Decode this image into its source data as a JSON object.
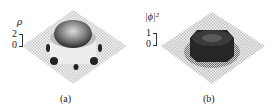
{
  "figure": {
    "panels": [
      {
        "id": "a",
        "caption": "(a)",
        "quantity_label": "ρ",
        "scale_ticks": [
          "2",
          "0"
        ],
        "description": "3D surface plot on checkered grid: central dome surrounded by ring wall with dark spots"
      },
      {
        "id": "b",
        "caption": "(b)",
        "quantity_label": "|ϕ|²",
        "scale_ticks": [
          "1",
          "0"
        ],
        "description": "3D surface plot on checkered grid: dark central plateau with surrounding structure"
      }
    ]
  }
}
